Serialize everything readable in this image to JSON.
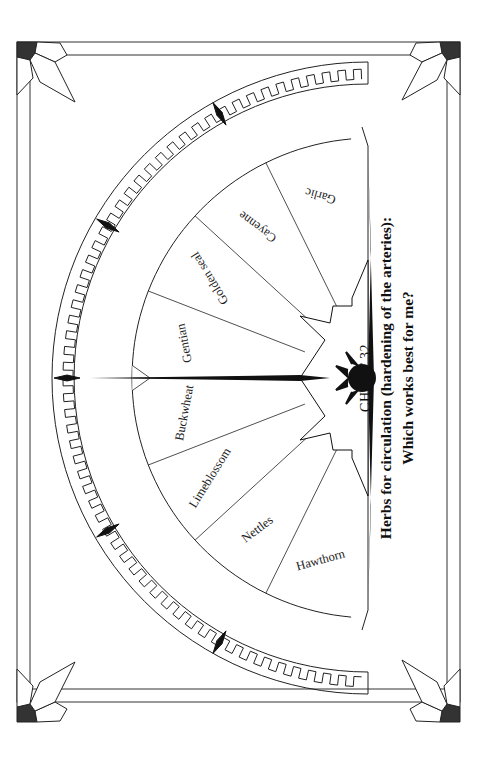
{
  "chart": {
    "number_label": "CHART 32",
    "title_line1": "Herbs for circulation  (hardening of the arteries):",
    "title_line2": "Which works best for me?"
  },
  "sectors": [
    {
      "label": "Garlic"
    },
    {
      "label": "Cayenne"
    },
    {
      "label": "Golden seal"
    },
    {
      "label": "Gentian"
    },
    {
      "label": "Buckwheat"
    },
    {
      "label": "Limeblossom"
    },
    {
      "label": "Nettles"
    },
    {
      "label": "Hawthorn"
    }
  ],
  "colors": {
    "ink": "#1a1a1a",
    "paper": "#ffffff"
  }
}
